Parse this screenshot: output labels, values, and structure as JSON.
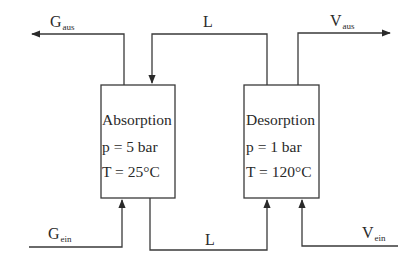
{
  "diagram": {
    "colors": {
      "line": "#3a3a3a",
      "text": "#2a2a2a",
      "background": "#ffffff"
    },
    "units": [
      {
        "id": "absorption",
        "title": "Absorption",
        "pressure": "p = 5 bar",
        "temperature": "T = 25°C"
      },
      {
        "id": "desorption",
        "title": "Desorption",
        "pressure": "p = 1 bar",
        "temperature": "T = 120°C"
      }
    ],
    "streams": {
      "gas_out": {
        "main": "G",
        "sub": "aus"
      },
      "gas_in": {
        "main": "G",
        "sub": "ein"
      },
      "vapor_out": {
        "main": "V",
        "sub": "aus"
      },
      "vapor_in": {
        "main": "V",
        "sub": "ein"
      },
      "liquid_top": {
        "main": "L"
      },
      "liquid_bottom": {
        "main": "L"
      }
    }
  }
}
